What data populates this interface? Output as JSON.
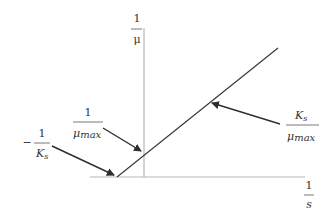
{
  "diagram": {
    "type": "lineweaver-burk-plot",
    "axes": {
      "y_label": {
        "numerator": "1",
        "denominator": "μ"
      },
      "x_label": {
        "numerator": "1",
        "denominator": "s"
      }
    },
    "annotations": {
      "y_intercept": {
        "numerator": "1",
        "denominator_main": "μ",
        "denominator_sub": "max"
      },
      "x_intercept": {
        "sign": "−",
        "numerator": "1",
        "denominator_main": "K",
        "denominator_sub": "s"
      },
      "slope": {
        "numerator_main": "K",
        "numerator_sub": "s",
        "denominator_main": "μ",
        "denominator_sub": "max"
      }
    },
    "colors": {
      "axis": "#b8b8b8",
      "line": "#3a3a3a",
      "arrow": "#2e2e2e",
      "text": "#333333"
    }
  }
}
